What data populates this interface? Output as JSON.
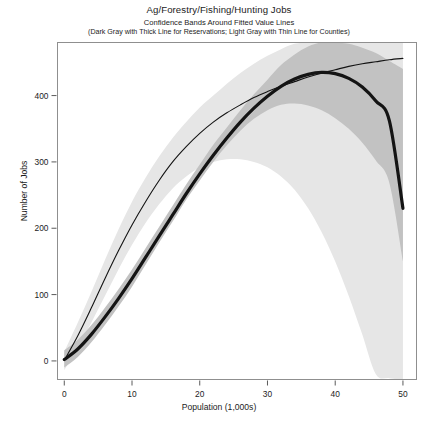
{
  "titles": {
    "main": "Ag/Forestry/Fishing/Hunting Jobs",
    "sub1": "Confidence Bands Around Fitted Value Lines",
    "sub2": "(Dark Gray with Thick Line for Reservations; Light Gray with Thin Line for Counties)"
  },
  "colors": {
    "reservations_band": "#c2c2c2",
    "counties_band": "#e6e6e6",
    "line": "#141414",
    "frame": "#8a8a8a",
    "text": "#1c1c1c"
  },
  "chart_data": {
    "type": "line",
    "title": "Ag/Forestry/Fishing/Hunting Jobs",
    "subtitle": "Confidence Bands Around Fitted Value Lines (Dark Gray with Thick Line for Reservations; Light Gray with Thin Line for Counties)",
    "xlabel": "Population (1,000s)",
    "ylabel": "Number of Jobs",
    "xlim": [
      -1,
      52
    ],
    "ylim": [
      -28,
      480
    ],
    "xticks": [
      0,
      10,
      20,
      30,
      40,
      50
    ],
    "yticks": [
      0,
      100,
      200,
      300,
      400
    ],
    "grid": false,
    "legend_position": "none",
    "x": [
      0,
      2,
      4,
      6,
      8,
      10,
      12,
      14,
      16,
      18,
      20,
      22,
      24,
      26,
      28,
      30,
      32,
      34,
      36,
      38,
      40,
      42,
      44,
      46,
      48,
      50
    ],
    "series": [
      {
        "name": "Reservations",
        "style": "thick",
        "values": [
          2,
          18,
          40,
          66,
          94,
          124,
          156,
          188,
          220,
          252,
          282,
          310,
          336,
          360,
          381,
          399,
          414,
          425,
          432,
          435,
          433,
          426,
          413,
          392,
          362,
          230
        ],
        "band_lower": [
          -10,
          6,
          28,
          54,
          82,
          112,
          145,
          178,
          210,
          243,
          272,
          300,
          325,
          347,
          365,
          378,
          386,
          388,
          385,
          378,
          366,
          350,
          329,
          302,
          268,
          150
        ],
        "band_upper": [
          16,
          32,
          54,
          80,
          108,
          138,
          170,
          202,
          234,
          266,
          296,
          326,
          352,
          378,
          402,
          424,
          446,
          462,
          474,
          480,
          480,
          478,
          472,
          464,
          452,
          440
        ]
      },
      {
        "name": "Counties",
        "style": "thin",
        "values": [
          1,
          38,
          80,
          124,
          166,
          205,
          240,
          272,
          300,
          323,
          343,
          360,
          374,
          386,
          397,
          406,
          414,
          421,
          428,
          434,
          439,
          444,
          448,
          451,
          454,
          456
        ],
        "band_lower": [
          -14,
          20,
          58,
          98,
          138,
          175,
          208,
          236,
          260,
          278,
          292,
          300,
          304,
          304,
          300,
          292,
          278,
          258,
          230,
          194,
          150,
          98,
          40,
          -20,
          -26,
          -28
        ],
        "band_upper": [
          14,
          58,
          104,
          152,
          198,
          240,
          276,
          308,
          336,
          360,
          382,
          400,
          418,
          434,
          448,
          460,
          470,
          478,
          480,
          480,
          480,
          480,
          480,
          480,
          480,
          480
        ]
      }
    ]
  },
  "axes": {
    "y_ticks": [
      "400",
      "300",
      "200",
      "100",
      "0"
    ],
    "x_ticks": [
      "0",
      "10",
      "20",
      "30",
      "40",
      "50"
    ],
    "y_title": "Number of Jobs",
    "x_title": "Population (1,000s)"
  }
}
